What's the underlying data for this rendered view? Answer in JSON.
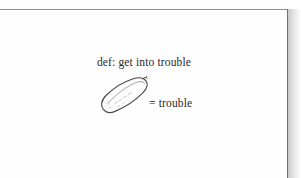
{
  "page": {
    "background_color": "#fefefe",
    "edge_line_color": "#6f6f6f",
    "rule_color": "#8e8e8e",
    "shadow_color": "#c9c9c9"
  },
  "content": {
    "definition_text": "def: get into trouble",
    "equation_text": "= trouble",
    "illustration": {
      "name": "pickle-drawing",
      "description": "hand-drawn pickle",
      "ink_color": "#4a4a4a"
    },
    "text_color": "#2a2a2a"
  }
}
